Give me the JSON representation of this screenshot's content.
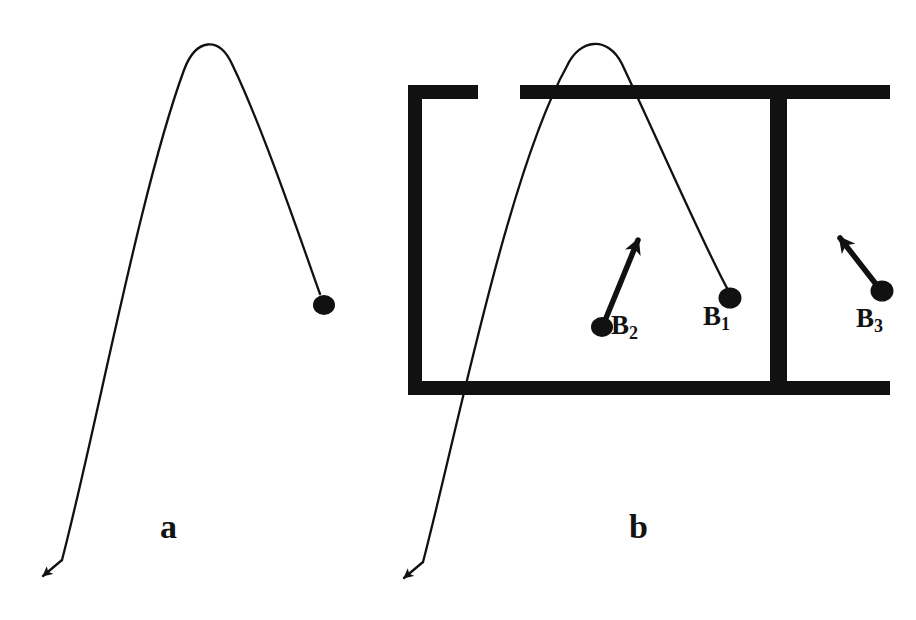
{
  "figure": {
    "kind": "physics-diagram",
    "background_color": "#ffffff",
    "ink_color": "#111111",
    "panels": [
      {
        "id": "a",
        "label": "a",
        "caption_position": "bottom-center"
      },
      {
        "id": "b",
        "label": "b",
        "caption_position": "bottom-center"
      }
    ]
  },
  "panel_a": {
    "label": "a",
    "trajectory": {
      "name": "parabolic-trajectory",
      "description": "parabolic arc rising from lower-left, peaking, then descending to a ball; a second branch descends to an arrowhead at lower-left",
      "apex": {
        "x": 207,
        "y": 38
      },
      "arrow_tip": {
        "x": 41,
        "y": 578
      }
    },
    "ball": {
      "name": "B",
      "x": 324,
      "y": 305,
      "rx": 11,
      "ry": 10
    }
  },
  "panel_b": {
    "label": "b",
    "trajectory": {
      "name": "parabolic-trajectory",
      "description": "same parabolic arc overlaid on the apparatus; apex rises above the top wall, descends to ball B1, and a second branch descends through the box to an arrowhead at lower-left",
      "apex": {
        "x": 597,
        "y": 37
      },
      "arrow_tip": {
        "x": 402,
        "y": 580
      }
    },
    "apparatus": {
      "name": "open-box-with-partition",
      "left_wall": {
        "x1": 414,
        "y1": 92,
        "x2": 414,
        "y2": 389
      },
      "top_wall_left": {
        "x1": 408,
        "y1": 92,
        "x2": 478,
        "y2": 92
      },
      "top_wall_gap": {
        "from_x": 478,
        "to_x": 520
      },
      "top_wall_right": {
        "x1": 520,
        "y1": 92,
        "x2": 890,
        "y2": 92
      },
      "bottom_wall": {
        "x1": 408,
        "y1": 389,
        "x2": 890,
        "y2": 389
      },
      "partition": {
        "x1": 778,
        "y1": 86,
        "x2": 778,
        "y2": 395
      },
      "stroke_width": 13
    },
    "balls": [
      {
        "id": "B1",
        "label": "B",
        "subscript": "1",
        "x": 730,
        "y": 298,
        "rx": 11,
        "ry": 10,
        "has_velocity_arrow": false,
        "note": "ball at end of descending trajectory, inside left compartment"
      },
      {
        "id": "B2",
        "label": "B",
        "subscript": "2",
        "x": 602,
        "y": 327,
        "rx": 11,
        "ry": 10,
        "has_velocity_arrow": true,
        "arrow": {
          "from_x": 602,
          "from_y": 327,
          "to_x": 643,
          "to_y": 228,
          "direction": "up-right"
        }
      },
      {
        "id": "B3",
        "label": "B",
        "subscript": "3",
        "x": 882,
        "y": 291,
        "rx": 11,
        "ry": 10,
        "has_velocity_arrow": true,
        "arrow": {
          "from_x": 882,
          "from_y": 291,
          "to_x": 833,
          "to_y": 228,
          "direction": "up-left"
        },
        "note": "ball in right compartment, outside the partition"
      }
    ]
  }
}
